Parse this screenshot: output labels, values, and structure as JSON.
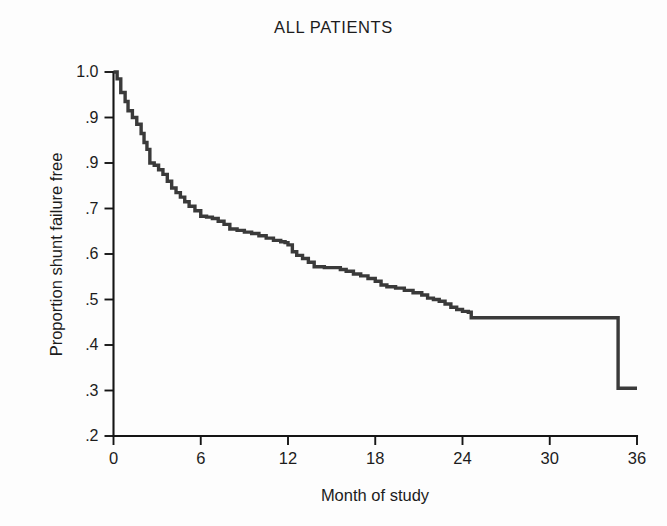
{
  "chart_data": {
    "type": "line",
    "title": "ALL PATIENTS",
    "subtitle": "",
    "xlabel": "Month of study",
    "ylabel": "Proportion shunt failure free",
    "xlim": [
      0,
      36
    ],
    "ylim": [
      0.2,
      1.0
    ],
    "grid": false,
    "legend": null,
    "legend_position": "none",
    "curve_style": "kaplan-meier-step",
    "xticks": [
      0,
      6,
      12,
      18,
      24,
      30,
      36
    ],
    "xtick_labels": [
      "0",
      "6",
      "12",
      "18",
      "24",
      "30",
      "36"
    ],
    "yticks": [
      1.0,
      0.9,
      0.8,
      0.7,
      0.6,
      0.5,
      0.4,
      0.3,
      0.2
    ],
    "ytick_labels": [
      "1.0",
      ".9",
      ".9",
      ".7",
      ".6",
      ".5",
      ".4",
      ".3",
      ".2"
    ],
    "series": [
      {
        "name": "All patients",
        "color": "#3a3a3a",
        "x": [
          0,
          0.25,
          0.5,
          0.8,
          1.0,
          1.3,
          1.6,
          1.9,
          2.1,
          2.3,
          2.5,
          2.8,
          3.1,
          3.4,
          3.7,
          4.0,
          4.3,
          4.6,
          4.9,
          5.2,
          5.6,
          6.0,
          6.4,
          6.8,
          7.2,
          7.6,
          8.0,
          8.5,
          9.0,
          9.5,
          10.0,
          10.5,
          11.0,
          11.5,
          11.8,
          12.0,
          12.3,
          12.6,
          13.0,
          13.4,
          13.8,
          14.5,
          15.2,
          15.6,
          16.0,
          16.5,
          17.0,
          17.5,
          18.0,
          18.4,
          18.8,
          19.4,
          20.0,
          20.6,
          21.2,
          21.6,
          22.0,
          22.4,
          22.8,
          23.2,
          23.6,
          24.0,
          24.4,
          24.6,
          28.0,
          31.0,
          34.0,
          34.6,
          34.7,
          36.0
        ],
        "y": [
          1.0,
          0.985,
          0.955,
          0.935,
          0.915,
          0.9,
          0.885,
          0.865,
          0.845,
          0.83,
          0.8,
          0.795,
          0.785,
          0.775,
          0.76,
          0.745,
          0.735,
          0.725,
          0.715,
          0.705,
          0.695,
          0.683,
          0.681,
          0.678,
          0.672,
          0.665,
          0.655,
          0.652,
          0.648,
          0.645,
          0.64,
          0.635,
          0.63,
          0.627,
          0.625,
          0.62,
          0.605,
          0.597,
          0.59,
          0.582,
          0.572,
          0.57,
          0.57,
          0.566,
          0.562,
          0.556,
          0.552,
          0.546,
          0.54,
          0.532,
          0.528,
          0.525,
          0.52,
          0.515,
          0.51,
          0.503,
          0.5,
          0.496,
          0.49,
          0.483,
          0.478,
          0.474,
          0.472,
          0.46,
          0.46,
          0.46,
          0.46,
          0.46,
          0.305,
          0.305
        ]
      }
    ],
    "annotations": [
      {
        "text": "long plateau at ~0.46 from month 24.6 to 34.6"
      },
      {
        "text": "terminal vertical drop to ~0.305 at month ~34.6"
      }
    ]
  },
  "figure": {
    "title": "ALL PATIENTS",
    "x_axis_title": "Month of study",
    "y_axis_title": "Proportion shunt failure free"
  }
}
